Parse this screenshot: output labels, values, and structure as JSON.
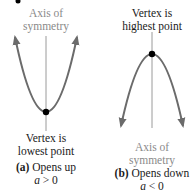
{
  "panels": [
    {
      "id": "a",
      "axis_label": [
        "Axis of",
        "symmetry"
      ],
      "vertex_label": [
        "Vertex is",
        "lowest point"
      ],
      "caption_letter": "(a)",
      "caption_text": " Opens up",
      "condition_var": "a",
      "condition_rest": " > 0"
    },
    {
      "id": "b",
      "vertex_label": [
        "Vertex is",
        "highest point"
      ],
      "axis_label": [
        "Axis of",
        "symmetry"
      ],
      "caption_letter": "(b)",
      "caption_text": " Opens down",
      "condition_var": "a",
      "condition_rest": " < 0"
    }
  ],
  "colors": {
    "curve": "#6b6b6b",
    "axis_line": "#9a9a9a",
    "vertex_dot": "#000000",
    "label_gray": "#8a8a8a",
    "label_black": "#1a1a1a"
  }
}
